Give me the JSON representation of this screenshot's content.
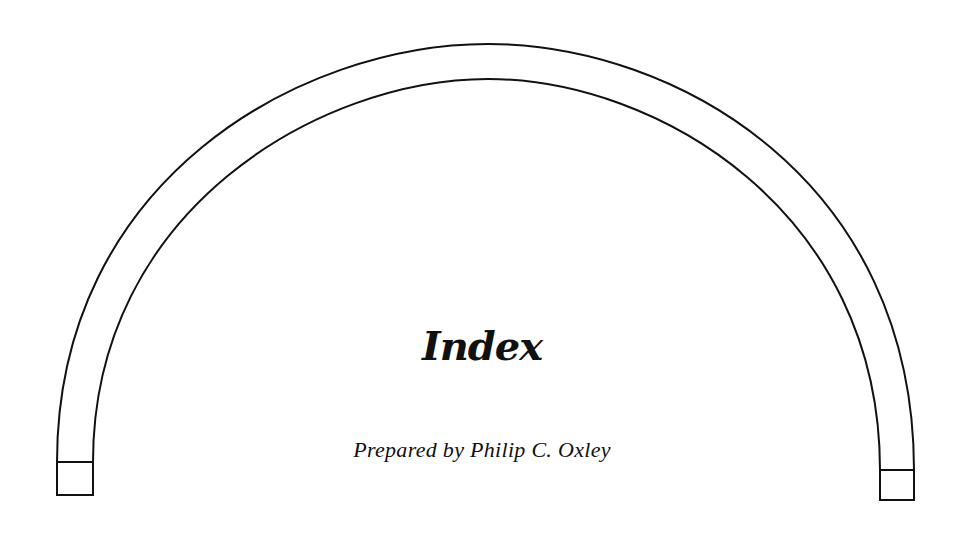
{
  "document": {
    "title": "Index",
    "subtitle": "Prepared by Philip C. Oxley"
  },
  "colors": {
    "ink": "#111111",
    "background": "#ffffff"
  }
}
